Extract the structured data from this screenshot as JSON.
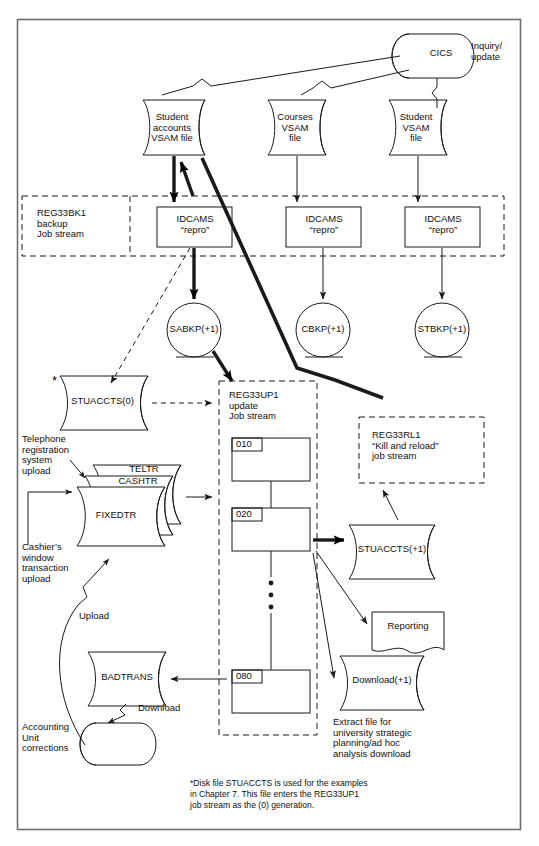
{
  "diagram": {
    "border_color": "#6e6e6e",
    "line_color": "#1a1a1a",
    "fill_color": "#ffffff",
    "online": {
      "cics_label": "CICS",
      "cics_role": "Inquiry/\nupdate"
    },
    "vsam_files": [
      {
        "id": "student-accounts-vsam",
        "label": "Student\naccounts\nVSAM file"
      },
      {
        "id": "courses-vsam",
        "label": "Courses\nVSAM\nfile"
      },
      {
        "id": "student-vsam",
        "label": "Student\nVSAM\nfile"
      }
    ],
    "backup_stream": {
      "caption": "REG33BK1\nbackup\nJob stream",
      "steps": [
        {
          "id": "idcams-repro-1",
          "label": "IDCAMS\n“repro”"
        },
        {
          "id": "idcams-repro-2",
          "label": "IDCAMS\n“repro”"
        },
        {
          "id": "idcams-repro-3",
          "label": "IDCAMS\n“repro”"
        }
      ],
      "tapes": [
        {
          "id": "sabkp-tape",
          "label": "SABKP(+1)"
        },
        {
          "id": "cbkp-tape",
          "label": "CBKP(+1)"
        },
        {
          "id": "stbkp-tape",
          "label": "STBKP(+1)"
        }
      ]
    },
    "update_stream": {
      "caption": "REG33UP1\nupdate\nJob stream",
      "steps": [
        {
          "id": "step-010",
          "label": "010"
        },
        {
          "id": "step-020",
          "label": "020"
        },
        {
          "id": "step-080",
          "label": "080"
        }
      ],
      "ellipsis": "• • •"
    },
    "reload_stream": {
      "caption": "REG33RL1\n“Kill and reload”\njob stream"
    },
    "disk_files": [
      {
        "id": "stuaccts-0",
        "label": "STUACCTS(0)",
        "asterisk": "*"
      },
      {
        "id": "stuaccts-p1",
        "label": "STUACCTS(+1)"
      },
      {
        "id": "download-p1",
        "label": "Download(+1)"
      },
      {
        "id": "badtrans",
        "label": "BADTRANS"
      }
    ],
    "transaction_stack": [
      {
        "id": "teltr",
        "label": "TELTR"
      },
      {
        "id": "cashtr",
        "label": "CASHTR"
      },
      {
        "id": "fixedtr",
        "label": "FIXEDTR"
      }
    ],
    "report": {
      "id": "reporting-doc",
      "label": "Reporting"
    },
    "annotations": [
      {
        "id": "telephone-upload",
        "text": "Telephone\nregistration\nsystem\nupload"
      },
      {
        "id": "cashier-upload",
        "text": "Cashier’s\nwindow\ntransaction\nupload"
      },
      {
        "id": "upload-label",
        "text": "Upload"
      },
      {
        "id": "download-label",
        "text": "Download"
      },
      {
        "id": "accounting-unit",
        "text": "Accounting\nUnit\ncorrections"
      },
      {
        "id": "extract-file-note",
        "text": "Extract file for\nuniversity strategic\nplanning/ad hoc\nanalysis download"
      }
    ],
    "footnote": "*Disk file STUACCTS is used for the examples\n in Chapter 7. This file enters the REG33UP1\n job stream as the (0) generation."
  }
}
